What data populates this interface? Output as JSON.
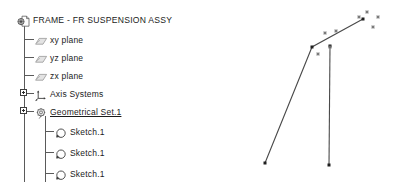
{
  "tree": {
    "root": {
      "label": "FRAME - FR SUSPENSION ASSY",
      "icon": "part-document-icon"
    },
    "nodes": [
      {
        "label": "xy plane",
        "icon": "plane-icon",
        "level": 1,
        "expandable": false,
        "active": false
      },
      {
        "label": "yz plane",
        "icon": "plane-icon",
        "level": 1,
        "expandable": false,
        "active": false
      },
      {
        "label": "zx plane",
        "icon": "plane-icon",
        "level": 1,
        "expandable": false,
        "active": false
      },
      {
        "label": "Axis Systems",
        "icon": "axis-system-icon",
        "level": 1,
        "expandable": true,
        "active": false
      },
      {
        "label": "Geometrical Set.1",
        "icon": "geometrical-set-icon",
        "level": 1,
        "expandable": true,
        "active": true
      },
      {
        "label": "Sketch.1",
        "icon": "sketch-icon",
        "level": 2,
        "expandable": false,
        "active": false
      },
      {
        "label": "Sketch.1",
        "icon": "sketch-icon",
        "level": 2,
        "expandable": false,
        "active": false
      },
      {
        "label": "Sketch.1",
        "icon": "sketch-icon",
        "level": 2,
        "expandable": false,
        "active": false
      }
    ]
  },
  "viewport": {
    "name": "3d-geometry-view",
    "background": "#ffffff",
    "line_color": "#4a4a4a",
    "point_color": "#6f6f6f",
    "vertex_color": "#1f1f1f",
    "polylines": [
      {
        "name": "main-bent-line",
        "points": [
          [
            35,
            163
          ],
          [
            82,
            47
          ],
          [
            133,
            19
          ]
        ]
      },
      {
        "name": "vertical-strut",
        "points": [
          [
            100,
            46
          ],
          [
            99,
            165
          ]
        ]
      }
    ],
    "vertices": [
      {
        "name": "vertex-lower-left",
        "x": 35,
        "y": 163
      },
      {
        "name": "vertex-bend",
        "x": 82,
        "y": 47
      },
      {
        "name": "vertex-upper-right",
        "x": 133,
        "y": 19
      },
      {
        "name": "vertex-strut-top",
        "x": 100,
        "y": 46
      },
      {
        "name": "vertex-strut-bottom",
        "x": 99,
        "y": 165
      }
    ],
    "construction_points": [
      {
        "name": "construction-point-1",
        "x": 95,
        "y": 33
      },
      {
        "name": "construction-point-2",
        "x": 106,
        "y": 31
      },
      {
        "name": "construction-point-3",
        "x": 88,
        "y": 54
      },
      {
        "name": "construction-point-4",
        "x": 100,
        "y": 47
      },
      {
        "name": "construction-point-5",
        "x": 129,
        "y": 17
      },
      {
        "name": "construction-point-6",
        "x": 137,
        "y": 12
      },
      {
        "name": "construction-point-7",
        "x": 148,
        "y": 17
      },
      {
        "name": "construction-point-8",
        "x": 143,
        "y": 27
      }
    ]
  }
}
